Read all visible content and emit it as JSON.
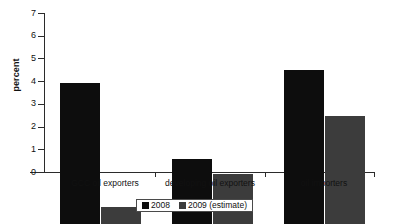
{
  "chart_data": {
    "type": "bar",
    "title": "",
    "xlabel": "",
    "ylabel": "percent",
    "ylim": [
      0,
      7
    ],
    "yticks": [
      0,
      1,
      2,
      3,
      4,
      5,
      6,
      7
    ],
    "ytick_labels": [
      "0",
      "1",
      "2",
      "3",
      "4",
      "5",
      "6",
      "7"
    ],
    "grid": false,
    "legend_position": "bottom-center",
    "categories": [
      "GCC oil exporters",
      "developing oil exporters",
      "oil importers"
    ],
    "series": [
      {
        "name": "2008",
        "color": "#0d0d0d",
        "values": [
          6.2,
          2.85,
          6.8
        ]
      },
      {
        "name": "2009 (estimate)",
        "color": "#3c3c3c",
        "values": [
          0.75,
          2.2,
          4.75
        ]
      }
    ]
  },
  "legend": {
    "entries": [
      {
        "label": "2008",
        "swatch_name": "legend-swatch-2008"
      },
      {
        "label": "2009 (estimate)",
        "swatch_name": "legend-swatch-2009"
      }
    ]
  },
  "axes": {
    "y_title": "percent",
    "y_tick_0": "0",
    "y_tick_1": "1",
    "y_tick_2": "2",
    "y_tick_3": "3",
    "y_tick_4": "4",
    "y_tick_5": "5",
    "y_tick_6": "6",
    "y_tick_7": "7",
    "x_cat_0": "GCC oil exporters",
    "x_cat_1": "developing oil exporters",
    "x_cat_2": "oil importers"
  },
  "colors": {
    "series_2008": "#0d0d0d",
    "series_2009": "#3c3c3c",
    "axis": "#2b2b2b",
    "background": "#ffffff"
  }
}
